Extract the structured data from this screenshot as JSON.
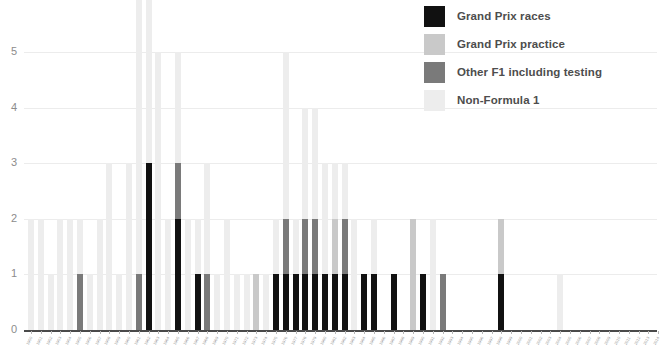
{
  "chart_data": {
    "type": "bar",
    "subtype": "stacked",
    "title": "",
    "xlabel": "",
    "ylabel": "",
    "ylim": [
      0,
      6
    ],
    "yticks": [
      0,
      1,
      2,
      3,
      4,
      5,
      6
    ],
    "ytick_labels": [
      "0",
      "1",
      "2",
      "3",
      "4",
      "5",
      "6"
    ],
    "grid": true,
    "legend_position": "top-right",
    "series": [
      {
        "name": "Grand Prix races",
        "color": "#111111"
      },
      {
        "name": "Grand Prix practice",
        "color": "#c9c9c9"
      },
      {
        "name": "Other F1 including testing",
        "color": "#7a7a7a"
      },
      {
        "name": "Non-Formula 1",
        "color": "#ededed"
      }
    ],
    "categories": [
      "1950",
      "1951",
      "1952",
      "1953",
      "1954",
      "1955",
      "1956",
      "1957",
      "1958",
      "1959",
      "1960",
      "1961",
      "1962",
      "1963",
      "1964",
      "1965",
      "1966",
      "1967",
      "1968",
      "1969",
      "1970",
      "1971",
      "1972",
      "1973",
      "1974",
      "1975",
      "1976",
      "1977",
      "1978",
      "1979",
      "1980",
      "1981",
      "1982",
      "1983",
      "1984",
      "1985",
      "1986",
      "1987",
      "1988",
      "1989",
      "1990",
      "1991",
      "1992",
      "1993",
      "1994",
      "1995",
      "1996",
      "1997",
      "1998",
      "1999",
      "2000",
      "2001",
      "2002",
      "2003",
      "2004",
      "2005",
      "2006",
      "2007",
      "2008",
      "2009",
      "2010",
      "2011",
      "2012",
      "2013",
      "2014"
    ],
    "stacks": [
      {
        "races": 0,
        "practice": 0,
        "other_f1": 0,
        "non_f1": 2
      },
      {
        "races": 0,
        "practice": 0,
        "other_f1": 0,
        "non_f1": 2
      },
      {
        "races": 0,
        "practice": 0,
        "other_f1": 0,
        "non_f1": 1
      },
      {
        "races": 0,
        "practice": 0,
        "other_f1": 0,
        "non_f1": 2
      },
      {
        "races": 0,
        "practice": 0,
        "other_f1": 0,
        "non_f1": 2
      },
      {
        "races": 0,
        "practice": 0,
        "other_f1": 1,
        "non_f1": 1
      },
      {
        "races": 0,
        "practice": 0,
        "other_f1": 0,
        "non_f1": 1
      },
      {
        "races": 0,
        "practice": 0,
        "other_f1": 0,
        "non_f1": 2
      },
      {
        "races": 0,
        "practice": 0,
        "other_f1": 0,
        "non_f1": 3
      },
      {
        "races": 0,
        "practice": 0,
        "other_f1": 0,
        "non_f1": 1
      },
      {
        "races": 0,
        "practice": 0,
        "other_f1": 0,
        "non_f1": 3
      },
      {
        "races": 0,
        "practice": 0,
        "other_f1": 1,
        "non_f1": 7
      },
      {
        "races": 3,
        "practice": 0,
        "other_f1": 0,
        "non_f1": 4
      },
      {
        "races": 0,
        "practice": 0,
        "other_f1": 0,
        "non_f1": 5
      },
      {
        "races": 0,
        "practice": 0,
        "other_f1": 0,
        "non_f1": 2
      },
      {
        "races": 2,
        "practice": 0,
        "other_f1": 1,
        "non_f1": 2
      },
      {
        "races": 0,
        "practice": 0,
        "other_f1": 0,
        "non_f1": 2
      },
      {
        "races": 1,
        "practice": 0,
        "other_f1": 0,
        "non_f1": 1
      },
      {
        "races": 0,
        "practice": 0,
        "other_f1": 1,
        "non_f1": 2
      },
      {
        "races": 0,
        "practice": 0,
        "other_f1": 0,
        "non_f1": 1
      },
      {
        "races": 0,
        "practice": 0,
        "other_f1": 0,
        "non_f1": 2
      },
      {
        "races": 0,
        "practice": 0,
        "other_f1": 0,
        "non_f1": 1
      },
      {
        "races": 0,
        "practice": 0,
        "other_f1": 0,
        "non_f1": 1
      },
      {
        "races": 0,
        "practice": 1,
        "other_f1": 0,
        "non_f1": 0
      },
      {
        "races": 0,
        "practice": 0,
        "other_f1": 0,
        "non_f1": 1
      },
      {
        "races": 1,
        "practice": 0,
        "other_f1": 0,
        "non_f1": 1
      },
      {
        "races": 1,
        "practice": 0,
        "other_f1": 1,
        "non_f1": 3
      },
      {
        "races": 1,
        "practice": 0,
        "other_f1": 0,
        "non_f1": 1
      },
      {
        "races": 1,
        "practice": 0,
        "other_f1": 1,
        "non_f1": 2
      },
      {
        "races": 1,
        "practice": 0,
        "other_f1": 1,
        "non_f1": 2
      },
      {
        "races": 1,
        "practice": 0,
        "other_f1": 0,
        "non_f1": 2
      },
      {
        "races": 1,
        "practice": 1,
        "other_f1": 0,
        "non_f1": 1
      },
      {
        "races": 1,
        "practice": 0,
        "other_f1": 1,
        "non_f1": 1
      },
      {
        "races": 0,
        "practice": 0,
        "other_f1": 0,
        "non_f1": 2
      },
      {
        "races": 1,
        "practice": 0,
        "other_f1": 0,
        "non_f1": 0
      },
      {
        "races": 1,
        "practice": 0,
        "other_f1": 0,
        "non_f1": 1
      },
      {
        "races": 0,
        "practice": 0,
        "other_f1": 0,
        "non_f1": 0
      },
      {
        "races": 1,
        "practice": 0,
        "other_f1": 0,
        "non_f1": 0
      },
      {
        "races": 0,
        "practice": 0,
        "other_f1": 0,
        "non_f1": 0
      },
      {
        "races": 0,
        "practice": 2,
        "other_f1": 0,
        "non_f1": 0
      },
      {
        "races": 1,
        "practice": 0,
        "other_f1": 0,
        "non_f1": 0
      },
      {
        "races": 0,
        "practice": 0,
        "other_f1": 0,
        "non_f1": 2
      },
      {
        "races": 0,
        "practice": 0,
        "other_f1": 1,
        "non_f1": 0
      },
      {
        "races": 0,
        "practice": 0,
        "other_f1": 0,
        "non_f1": 0
      },
      {
        "races": 0,
        "practice": 0,
        "other_f1": 0,
        "non_f1": 0
      },
      {
        "races": 0,
        "practice": 0,
        "other_f1": 0,
        "non_f1": 0
      },
      {
        "races": 0,
        "practice": 0,
        "other_f1": 0,
        "non_f1": 0
      },
      {
        "races": 0,
        "practice": 0,
        "other_f1": 0,
        "non_f1": 0
      },
      {
        "races": 1,
        "practice": 1,
        "other_f1": 0,
        "non_f1": 0
      },
      {
        "races": 0,
        "practice": 0,
        "other_f1": 0,
        "non_f1": 0
      },
      {
        "races": 0,
        "practice": 0,
        "other_f1": 0,
        "non_f1": 0
      },
      {
        "races": 0,
        "practice": 0,
        "other_f1": 0,
        "non_f1": 0
      },
      {
        "races": 0,
        "practice": 0,
        "other_f1": 0,
        "non_f1": 0
      },
      {
        "races": 0,
        "practice": 0,
        "other_f1": 0,
        "non_f1": 0
      },
      {
        "races": 0,
        "practice": 0,
        "other_f1": 0,
        "non_f1": 1
      },
      {
        "races": 0,
        "practice": 0,
        "other_f1": 0,
        "non_f1": 0
      },
      {
        "races": 0,
        "practice": 0,
        "other_f1": 0,
        "non_f1": 0
      },
      {
        "races": 0,
        "practice": 0,
        "other_f1": 0,
        "non_f1": 0
      },
      {
        "races": 0,
        "practice": 0,
        "other_f1": 0,
        "non_f1": 0
      },
      {
        "races": 0,
        "practice": 0,
        "other_f1": 0,
        "non_f1": 0
      },
      {
        "races": 0,
        "practice": 0,
        "other_f1": 0,
        "non_f1": 0
      },
      {
        "races": 0,
        "practice": 0,
        "other_f1": 0,
        "non_f1": 0
      },
      {
        "races": 0,
        "practice": 0,
        "other_f1": 0,
        "non_f1": 0
      },
      {
        "races": 0,
        "practice": 0,
        "other_f1": 0,
        "non_f1": 0
      },
      {
        "races": 0,
        "practice": 0,
        "other_f1": 0,
        "non_f1": 0
      }
    ]
  },
  "legend": {
    "items": [
      {
        "label": "Grand Prix races",
        "color": "#111111",
        "key": "races"
      },
      {
        "label": "Grand Prix practice",
        "color": "#c9c9c9",
        "key": "practice"
      },
      {
        "label": "Other F1 including testing",
        "color": "#7a7a7a",
        "key": "other_f1"
      },
      {
        "label": "Non-Formula 1",
        "color": "#ededed",
        "key": "non_f1"
      }
    ]
  }
}
